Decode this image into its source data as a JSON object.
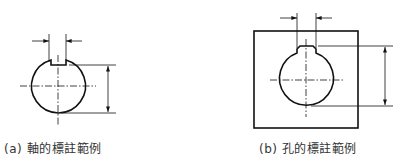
{
  "figures": [
    {
      "id": "a",
      "caption": "(a) 軸的標註範例",
      "subject": "shaft",
      "feature": "keyway"
    },
    {
      "id": "b",
      "caption": "(b) 孔的標註範例",
      "subject": "hole",
      "feature": "keyway"
    }
  ],
  "colors": {
    "line": "#111111",
    "text": "#333333",
    "background": "#ffffff"
  }
}
